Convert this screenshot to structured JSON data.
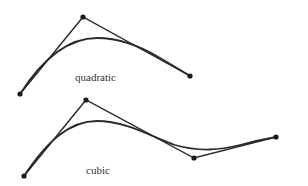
{
  "diagrams": [
    {
      "id": "quadratic",
      "label": "quadratic",
      "label_pos": [
        75,
        71
      ],
      "control_points": [
        [
          20,
          94
        ],
        [
          83,
          17
        ],
        [
          190,
          76
        ]
      ],
      "curve_path": "M20,94 C45,55 70,38 97,38 C120,38 140,46 160,58 C172,65 182,71 190,76"
    },
    {
      "id": "cubic",
      "label": "cubic",
      "label_pos": [
        86,
        164
      ],
      "control_points": [
        [
          24,
          176
        ],
        [
          86,
          100
        ],
        [
          194,
          158
        ],
        [
          276,
          137
        ]
      ],
      "curve_path": "M24,176 C48,140 70,121 97,121 C125,121 150,136 175,145 C200,152 220,150 240,145 C255,141 265,139 276,137"
    }
  ],
  "colors": {
    "stroke": "#2a2a2a",
    "point": "#1a1a1a",
    "background": "#ffffff"
  }
}
